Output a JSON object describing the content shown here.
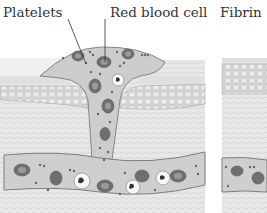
{
  "diagram": {
    "labels": {
      "platelets": "Platelets",
      "red_blood_cell": "Red blood cell",
      "fibrin": "Fibrin"
    },
    "panels": [
      {
        "name": "wound-panel",
        "content": "Skin cut with blood vessel; platelets and red blood cells filling the wound"
      },
      {
        "name": "fibrin-panel",
        "content": "Partially visible second panel labeled Fibrin"
      }
    ],
    "colors": {
      "background": "#ffffff",
      "tissue": "#e4e4e4",
      "epidermis": "#d6d6d6",
      "blood": "#cfcfcf",
      "red_cell": "#6e6e6e",
      "outline": "#8a8a8a",
      "text": "#333333"
    }
  }
}
